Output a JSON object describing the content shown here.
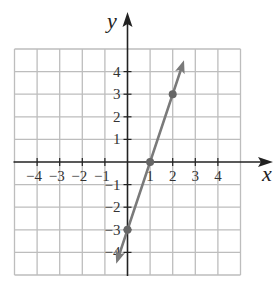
{
  "chart_data": {
    "type": "line",
    "title": "",
    "xlabel": "x",
    "ylabel": "y",
    "xlim": [
      -5,
      5
    ],
    "ylim": [
      -5,
      5
    ],
    "grid": true,
    "x_ticks": [
      -4,
      -3,
      -2,
      -1,
      1,
      2,
      3,
      4
    ],
    "y_ticks": [
      4,
      3,
      2,
      1,
      -1,
      -2,
      -3,
      -4
    ],
    "x_tick_labels": [
      "−4",
      "−3",
      "−2",
      "−1",
      "1",
      "2",
      "3",
      "4"
    ],
    "y_tick_labels": [
      "4",
      "3",
      "2",
      "1",
      "−1",
      "−2",
      "−3",
      "−4"
    ],
    "series": [
      {
        "name": "y = 3x - 3",
        "slope": 3,
        "intercept": -3,
        "line_start": [
          -0.5,
          -4.5
        ],
        "line_end": [
          2.5,
          4.5
        ],
        "arrows_both_ends": true,
        "points": [
          [
            0,
            -3
          ],
          [
            1,
            0
          ],
          [
            2,
            3
          ]
        ],
        "color": "#7a7a7a"
      }
    ]
  },
  "colors": {
    "grid": "#bdbdbd",
    "axis": "#222222",
    "line": "#7a7a7a",
    "point": "#666666"
  }
}
